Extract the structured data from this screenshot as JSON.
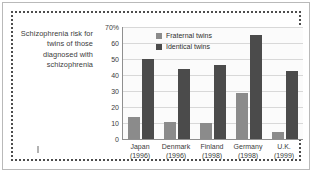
{
  "caption": {
    "text": "Schizophrenia risk for twins of those diagnosed with schizophrenia"
  },
  "chart_data": {
    "type": "bar",
    "title": "",
    "subtitle": "",
    "xlabel": "",
    "ylabel": "",
    "ylim": [
      0,
      70
    ],
    "yticks": [
      0,
      10,
      20,
      30,
      40,
      50,
      60,
      70
    ],
    "ytick_labels": [
      "0",
      "10",
      "20",
      "30",
      "40",
      "50",
      "60",
      "70%"
    ],
    "grid": true,
    "legend_position": "top-left inside plot",
    "categories": [
      "Japan",
      "Denmark",
      "Finland",
      "Germany",
      "U.K."
    ],
    "category_years": [
      "(1996)",
      "(1996)",
      "(1998)",
      "(1998)",
      "(1999)"
    ],
    "series": [
      {
        "name": "Fraternal twins",
        "color": "#8b8b8b",
        "values": [
          13.5,
          10.5,
          10,
          28.5,
          4.5
        ]
      },
      {
        "name": "Identical twins",
        "color": "#4b4b4b",
        "values": [
          50,
          44,
          46,
          65,
          42.5
        ]
      }
    ]
  },
  "style": {
    "plot_background": "#fbfbfb",
    "gridline_color": "#d8d8d8",
    "axis_color": "#8f8f8f",
    "frame_color": "#4d4d4d",
    "text_color": "#3b3b3b"
  }
}
